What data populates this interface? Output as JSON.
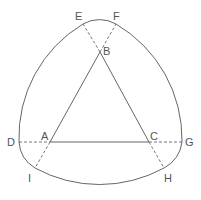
{
  "diagram": {
    "points": [
      {
        "id": "A",
        "label": "A",
        "x": 50,
        "y": 142,
        "lx": 40,
        "ly": 130
      },
      {
        "id": "B",
        "label": "B",
        "x": 100,
        "y": 52,
        "lx": 103,
        "ly": 46
      },
      {
        "id": "C",
        "label": "C",
        "x": 149,
        "y": 142,
        "lx": 151,
        "ly": 130
      },
      {
        "id": "D",
        "label": "D",
        "x": 19,
        "y": 142,
        "lx": 7,
        "ly": 137
      },
      {
        "id": "E",
        "label": "E",
        "x": 83,
        "y": 24,
        "lx": 75,
        "ly": 11
      },
      {
        "id": "F",
        "label": "F",
        "x": 116,
        "y": 24,
        "lx": 113,
        "ly": 11
      },
      {
        "id": "G",
        "label": "G",
        "x": 182,
        "y": 142,
        "lx": 185,
        "ly": 137
      },
      {
        "id": "H",
        "label": "H",
        "x": 164,
        "y": 168,
        "lx": 164,
        "ly": 173
      },
      {
        "id": "I",
        "label": "I",
        "x": 35,
        "y": 168,
        "lx": 27,
        "ly": 173
      }
    ],
    "stroke_color": "#666666",
    "label_color": "#555555"
  }
}
